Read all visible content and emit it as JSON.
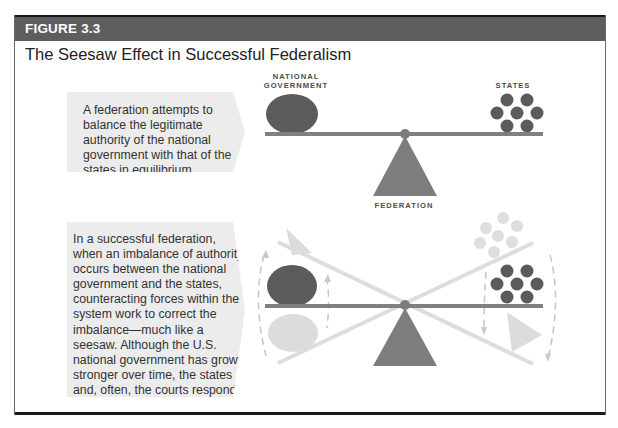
{
  "figure": {
    "number_label": "FIGURE 3.3",
    "title": "The Seesaw Effect in Successful Federalism"
  },
  "panels": [
    {
      "id": "equilibrium",
      "caption": "A federation attempts to balance the legitimate authority of the national government with that of the states in equilibrium.",
      "labels": {
        "left": "NATIONAL GOVERNMENT",
        "left_line1": "NATIONAL",
        "left_line2": "GOVERNMENT",
        "right": "STATES",
        "fulcrum": "FEDERATION"
      }
    },
    {
      "id": "counterbalance",
      "caption": "In a successful federation, when an imbalance of authority occurs between the national government and the states, counteracting forces within the system work to correct the imbalance—much like a seesaw. Although the U.S. national government has grown stronger over time, the states and, often, the courts respond vigorously when power shifts too far to the national side."
    }
  ],
  "colors": {
    "header_bar": "#5e5e5e",
    "dark_shape": "#5b5b5b",
    "beam": "#808080",
    "fulcrum": "#7d7d7d",
    "ghost": "#dcdcdc",
    "callout_bg": "#ececec"
  }
}
